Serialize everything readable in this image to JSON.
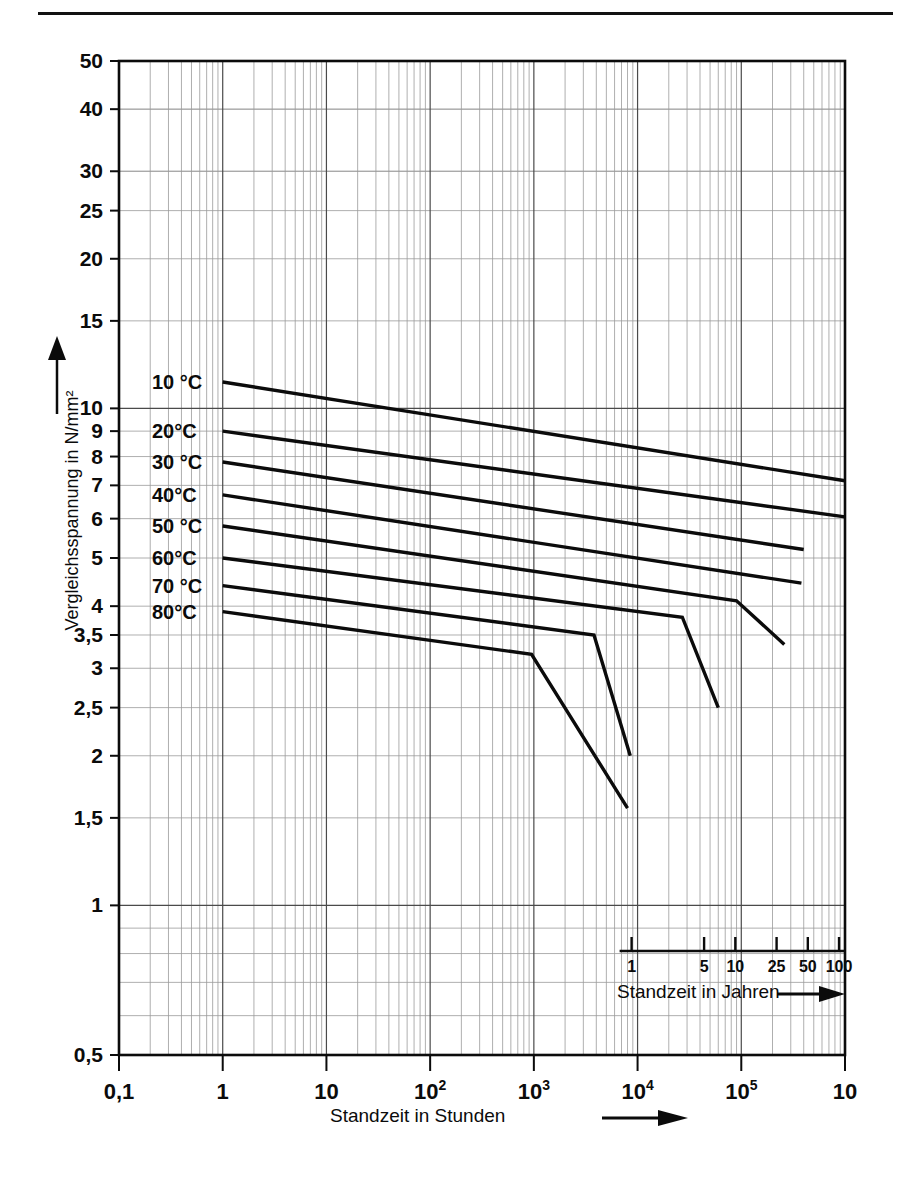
{
  "page": {
    "background": "#ffffff",
    "ink_color": "#0b0b0b",
    "grid_color": "#9a9a9a"
  },
  "chart_data": {
    "type": "line",
    "title": "",
    "xlabel": "Standzeit in Stunden",
    "ylabel": "Vergleichsspannung in N/mm²",
    "xscale": "log",
    "yscale": "log",
    "xlim": [
      0.1,
      1000000
    ],
    "ylim": [
      0.5,
      50
    ],
    "grid": true,
    "legend": "inline-labels-left",
    "x_ticklabels": [
      "0,1",
      "1",
      "10",
      "10²",
      "10³",
      "10⁴",
      "10⁵",
      "10"
    ],
    "x_tickvalues": [
      0.1,
      1,
      10,
      100,
      1000,
      10000,
      100000,
      1000000
    ],
    "y_ticklabels": [
      "50",
      "40",
      "30",
      "25",
      "20",
      "15",
      "10",
      "9",
      "8",
      "7",
      "6",
      "5",
      "4",
      "3,5",
      "3",
      "2,5",
      "2",
      "1,5",
      "1",
      "0,5"
    ],
    "y_tickvalues": [
      50,
      40,
      30,
      25,
      20,
      15,
      10,
      9,
      8,
      7,
      6,
      5,
      4,
      3.5,
      3,
      2.5,
      2,
      1.5,
      1,
      0.5
    ],
    "secondary_axis": {
      "label": "Standzeit in Jahren",
      "arrow": true,
      "ticklabels": [
        "1",
        "5",
        "10",
        "25",
        "50",
        "100"
      ],
      "tickvalues_years": [
        1,
        5,
        10,
        25,
        50,
        100
      ]
    },
    "series": [
      {
        "name": "10 °C",
        "label": "10 °C",
        "points": [
          [
            1,
            11.3
          ],
          [
            1000000,
            7.15
          ]
        ]
      },
      {
        "name": "20°C",
        "label": "20°C",
        "points": [
          [
            1,
            9.0
          ],
          [
            1000000,
            6.05
          ]
        ]
      },
      {
        "name": "30 °C",
        "label": "30 °C",
        "points": [
          [
            1,
            7.8
          ],
          [
            400000,
            5.2
          ]
        ]
      },
      {
        "name": "40°C",
        "label": "40°C",
        "points": [
          [
            1,
            6.7
          ],
          [
            380000,
            4.45
          ]
        ]
      },
      {
        "name": "50 °C",
        "label": "50 °C",
        "points": [
          [
            1,
            5.8
          ],
          [
            90000,
            4.1
          ],
          [
            260000,
            3.35
          ]
        ]
      },
      {
        "name": "60°C",
        "label": "60°C",
        "points": [
          [
            1,
            5.0
          ],
          [
            27000,
            3.8
          ],
          [
            60000,
            2.5
          ]
        ]
      },
      {
        "name": "70 °C",
        "label": "70 °C",
        "points": [
          [
            1,
            4.4
          ],
          [
            3800,
            3.5
          ],
          [
            8500,
            2.0
          ]
        ]
      },
      {
        "name": "80°C",
        "label": "80°C",
        "points": [
          [
            1,
            3.9
          ],
          [
            950,
            3.2
          ],
          [
            8000,
            1.57
          ]
        ]
      }
    ]
  },
  "axes": {
    "x_title": "Standzeit in Stunden",
    "y_title": "Vergleichsspannung in N/mm²",
    "x_arrow": "→",
    "y_arrow": "↑"
  }
}
